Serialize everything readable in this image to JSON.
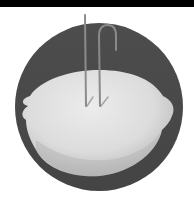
{
  "image": {
    "subject": "lemon-battery",
    "description": "Grayscale photo of a lemon with two metal wire electrodes inserted, inside a dark circular frame",
    "colors": {
      "frame": "#4a4a4a",
      "lemon_light": "#e4e4e4",
      "lemon_shadow": "#b8b8b8",
      "wire": "#8a8a8a",
      "topbar": "#000000",
      "background": "#ffffff"
    }
  }
}
